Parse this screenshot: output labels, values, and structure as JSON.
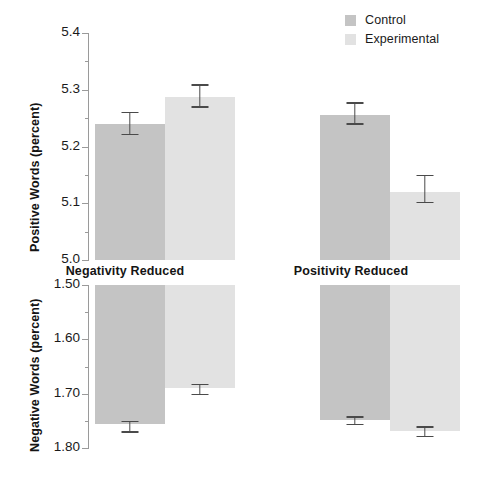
{
  "legend": {
    "position": "top-right",
    "items": [
      {
        "label": "Control",
        "color": "#c4c4c4"
      },
      {
        "label": "Experimental",
        "color": "#e2e2e2"
      }
    ]
  },
  "chart_data": {
    "type": "bar",
    "title": "",
    "layout": "2x2 panel grid (2 measures x 2 conditions)",
    "grid": false,
    "series_names": [
      "Control",
      "Experimental"
    ],
    "colors": {
      "Control": "#c4c4c4",
      "Experimental": "#e2e2e2"
    },
    "categories": [
      "Negativity Reduced",
      "Positivity Reduced"
    ],
    "panels": [
      {
        "id": "positive-negativity-reduced",
        "row": 0,
        "col": 0,
        "xlabel": "Negativity Reduced",
        "ylabel": "Positive Words (percent)",
        "ylim": [
          5.0,
          5.4
        ],
        "yticks": [
          "5.0",
          "5.1",
          "5.2",
          "5.3",
          "5.4"
        ],
        "ytick_values": [
          5.0,
          5.1,
          5.2,
          5.3,
          5.4
        ],
        "inverted": false,
        "bars": [
          {
            "name": "Control",
            "value": 5.24,
            "err_low": 5.22,
            "err_high": 5.261
          },
          {
            "name": "Experimental",
            "value": 5.288,
            "err_low": 5.268,
            "err_high": 5.31
          }
        ]
      },
      {
        "id": "positive-positivity-reduced",
        "row": 0,
        "col": 1,
        "xlabel": "Positivity Reduced",
        "ylabel": "",
        "ylim": [
          5.0,
          5.4
        ],
        "yticks": [],
        "ytick_values": [],
        "inverted": false,
        "bars": [
          {
            "name": "Control",
            "value": 5.256,
            "err_low": 5.238,
            "err_high": 5.278
          },
          {
            "name": "Experimental",
            "value": 5.12,
            "err_low": 5.1,
            "err_high": 5.15
          }
        ]
      },
      {
        "id": "negative-negativity-reduced",
        "row": 1,
        "col": 0,
        "xlabel": "",
        "ylabel": "Negative Words (percent)",
        "ylim": [
          1.5,
          1.8
        ],
        "yticks": [
          "1.50",
          "1.60",
          "1.70",
          "1.80"
        ],
        "ytick_values": [
          1.5,
          1.6,
          1.7,
          1.8
        ],
        "inverted": true,
        "bars": [
          {
            "name": "Control",
            "value": 1.755,
            "err_low": 1.75,
            "err_high": 1.772
          },
          {
            "name": "Experimental",
            "value": 1.69,
            "err_low": 1.682,
            "err_high": 1.703
          }
        ]
      },
      {
        "id": "negative-positivity-reduced",
        "row": 1,
        "col": 1,
        "xlabel": "",
        "ylabel": "",
        "ylim": [
          1.5,
          1.8
        ],
        "yticks": [],
        "ytick_values": [],
        "inverted": true,
        "bars": [
          {
            "name": "Control",
            "value": 1.748,
            "err_low": 1.742,
            "err_high": 1.758
          },
          {
            "name": "Experimental",
            "value": 1.768,
            "err_low": 1.76,
            "err_high": 1.78
          }
        ]
      }
    ]
  }
}
